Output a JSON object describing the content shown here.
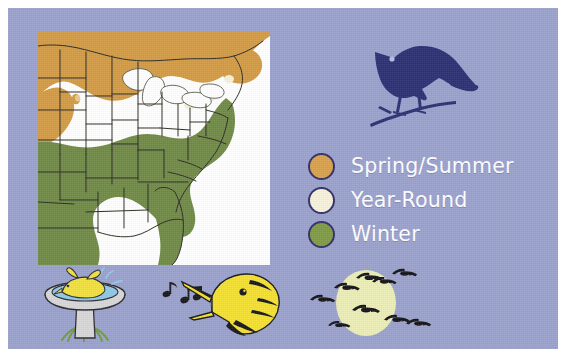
{
  "figure": {
    "name": "bird-range-map-figure",
    "background_color": "#9aa1cd",
    "border_color": "#ffffff"
  },
  "map": {
    "name": "north-america-range-map",
    "background_color": "#ffffff",
    "outline_color": "#2b2b22",
    "regions": [
      {
        "key": "spring_summer",
        "color": "#d39a42",
        "label": "Spring/Summer"
      },
      {
        "key": "year_round",
        "color": "#f5f1d8",
        "label": "Year-Round"
      },
      {
        "key": "winter",
        "color": "#6f8a45",
        "label": "Winter"
      }
    ],
    "water_color": "#ffffff"
  },
  "legend": {
    "name": "range-legend",
    "text_color": "#ffffff",
    "ring_color": "#312f66",
    "items": [
      {
        "label": "Spring/Summer",
        "color": "#d9a14a"
      },
      {
        "label": "Year-Round",
        "color": "#f6f2dc"
      },
      {
        "label": "Winter",
        "color": "#7f9a43"
      }
    ]
  },
  "illustrations": {
    "perched_bird": {
      "name": "perched-bird-silhouette",
      "alt": "dark blue songbird perched on a branch",
      "body_color": "#2c2f73",
      "eye_color": "#b9bede"
    },
    "birdbath": {
      "name": "bird-in-birdbath",
      "alt": "yellow bird bathing in a stone birdbath",
      "bird_color": "#f2e03a",
      "basin_color": "#d7d7d7",
      "water_color": "#8fc7e8",
      "grass_color": "#6f9a46",
      "outline_color": "#2b2b33"
    },
    "singing_bird": {
      "name": "singing-bird-head",
      "alt": "yellow bird head singing with music notes",
      "head_color": "#f5e02c",
      "marking_color": "#17171c",
      "note_color": "#17171c"
    },
    "geese_moon": {
      "name": "geese-flying-past-moon",
      "alt": "flock of geese flying in front of a pale moon",
      "moon_color": "#eceeb4",
      "goose_color": "#141418",
      "goose_count": 9
    }
  }
}
